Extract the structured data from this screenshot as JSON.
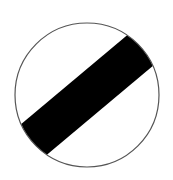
{
  "sign": {
    "name": "National speed limit applies",
    "type": "circular-regulatory-sign",
    "colors": {
      "background": "#ffffff",
      "border": "#555555",
      "stripe": "#000000"
    },
    "circle": {
      "cx": 87,
      "cy": 95,
      "r": 72
    },
    "stripe": {
      "angle_deg": -40,
      "width": 40
    }
  }
}
